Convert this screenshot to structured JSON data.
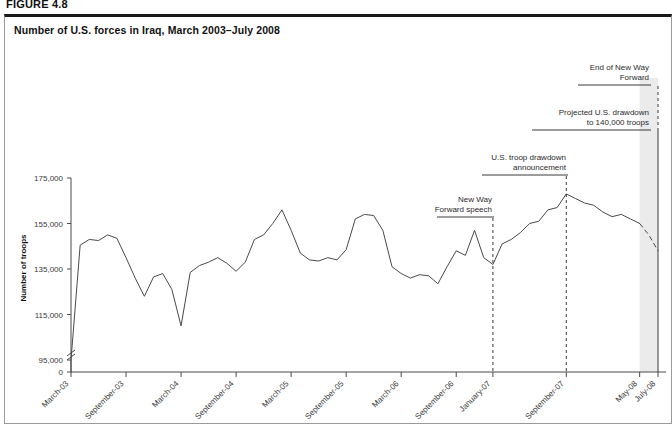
{
  "figure": {
    "label": "FIGURE 4.8",
    "title": "Number of U.S. forces in Iraq, March 2003–July 2008"
  },
  "chart_data": {
    "type": "line",
    "title": "Number of U.S. forces in Iraq, March 2003–July 2008",
    "xlabel": "",
    "ylabel": "Number of troops",
    "ylim": [
      95000,
      175000
    ],
    "yticks": [
      0,
      95000,
      115000,
      135000,
      155000,
      175000
    ],
    "ytick_labels": [
      "0",
      "95,000",
      "115,000",
      "135,000",
      "155,000",
      "175,000"
    ],
    "y_axis_break": true,
    "grid": false,
    "legend": "none",
    "xtick_labels": [
      "March-03",
      "September-03",
      "March-04",
      "September-04",
      "March-05",
      "September-05",
      "March-06",
      "September-06",
      "January-07",
      "September-07",
      "May-08",
      "July-08"
    ],
    "x": [
      "March-03",
      "April-03",
      "May-03",
      "June-03",
      "July-03",
      "August-03",
      "September-03",
      "October-03",
      "November-03",
      "December-03",
      "January-04",
      "February-04",
      "March-04",
      "April-04",
      "May-04",
      "June-04",
      "July-04",
      "August-04",
      "September-04",
      "October-04",
      "November-04",
      "December-04",
      "January-05",
      "February-05",
      "March-05",
      "April-05",
      "May-05",
      "June-05",
      "July-05",
      "August-05",
      "September-05",
      "October-05",
      "November-05",
      "December-05",
      "January-06",
      "February-06",
      "March-06",
      "April-06",
      "May-06",
      "June-06",
      "July-06",
      "August-06",
      "September-06",
      "October-06",
      "November-06",
      "December-06",
      "January-07",
      "February-07",
      "March-07",
      "April-07",
      "May-07",
      "June-07",
      "July-07",
      "August-07",
      "September-07",
      "October-07",
      "November-07",
      "December-07",
      "January-08",
      "February-08",
      "March-08",
      "April-08",
      "May-08",
      "June-08",
      "July-08"
    ],
    "values": [
      95000,
      145500,
      148000,
      147500,
      150000,
      148500,
      140000,
      131000,
      123000,
      131500,
      133000,
      126000,
      110000,
      133500,
      136500,
      138000,
      140000,
      137500,
      134000,
      138000,
      148000,
      150000,
      155000,
      161000,
      152000,
      142000,
      139000,
      138500,
      140000,
      139000,
      143500,
      157000,
      159000,
      158500,
      152000,
      136000,
      133000,
      131000,
      132500,
      132000,
      128500,
      136000,
      143000,
      141000,
      152000,
      140000,
      137000,
      146000,
      148000,
      151000,
      155000,
      156000,
      161000,
      162000,
      168000,
      166000,
      164000,
      163000,
      160000,
      158000,
      159000,
      157000,
      155000,
      150000,
      143000
    ],
    "projection_start": "May-08",
    "projection_note": "Dashed line segment from May-08 to July-08 indicates projected drawdown to 140,000 troops",
    "shaded_band": {
      "from": "May-08",
      "to": "July-08",
      "color": "#ebebeb"
    },
    "annotations": [
      {
        "name": "new-way-forward-speech",
        "text_lines": [
          "New Way",
          "Forward speech"
        ],
        "x": "January-07"
      },
      {
        "name": "us-troop-drawdown-announcement",
        "text_lines": [
          "U.S. troop drawdown",
          "announcement"
        ],
        "x": "September-07"
      },
      {
        "name": "projected-us-drawdown",
        "text_lines": [
          "Projected U.S. drawdown",
          "to 140,000 troops"
        ],
        "x": "July-08"
      },
      {
        "name": "end-of-new-way-forward",
        "text_lines": [
          "End of New Way",
          "Forward"
        ],
        "x": "July-08"
      }
    ]
  }
}
